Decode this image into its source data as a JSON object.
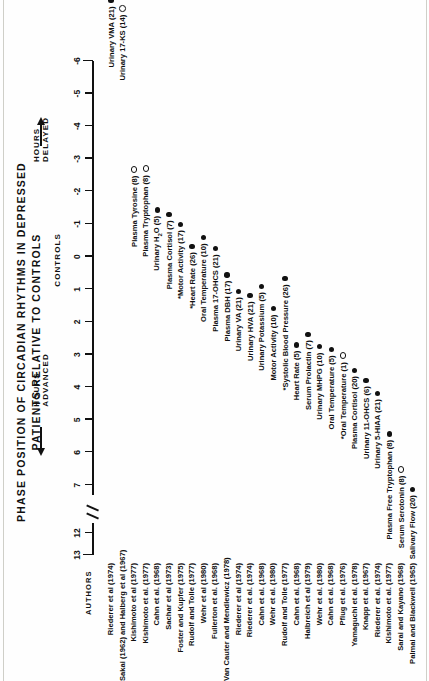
{
  "figure": {
    "title_line1": "PHASE  POSITION  OF  CIRCADIAN  RHYTHMS  IN  DEPRESSED",
    "title_line2": "PATIENTS  RELATIVE  TO  CONTROLS",
    "authors_header": "AUTHORS",
    "axis_label_left": "HOURS  ADVANCED",
    "axis_label_right": "HOURS  DELAYED",
    "axis_center_label": "CONTROLS",
    "tick_labels": [
      "13",
      "12",
      "7",
      "6",
      "5",
      "4",
      "3",
      "2",
      "1",
      "0",
      "-1",
      "-2",
      "-3",
      "-4",
      "-5",
      "-6"
    ],
    "legend_note": "Filled circle = significant/solid marker; Open circle = open marker"
  },
  "chart_data": {
    "type": "scatter",
    "title": "PHASE POSITION OF CIRCADIAN RHYTHMS IN DEPRESSED PATIENTS RELATIVE TO CONTROLS",
    "xlabel": "Hours advanced (positive) / Hours delayed (negative) relative to controls",
    "ylabel": "AUTHORS",
    "xlim": [
      13,
      -6
    ],
    "axis_break": {
      "between": [
        12,
        7
      ],
      "note": "axis break between 12 and 7"
    },
    "grid": false,
    "legend_position": "none",
    "tick_values": [
      13,
      12,
      7,
      6,
      5,
      4,
      3,
      2,
      1,
      0,
      -1,
      -2,
      -3,
      -4,
      -5,
      -6
    ],
    "tick_labels": [
      "13",
      "12",
      "7",
      "6",
      "5",
      "4",
      "3",
      "2",
      "1",
      "0",
      "-1",
      "-2",
      "-3",
      "-4",
      "-5",
      "-6"
    ],
    "marker_types": {
      "filled": "closed circle",
      "open": "open circle"
    },
    "points": [
      {
        "author": "Riederer et al  (1974)",
        "variable": "Urinary VMA (21)",
        "n": 21,
        "x": -6.0,
        "marker": "filled",
        "starred": false
      },
      {
        "author": "Sakai (1962) and Halberg et al  (1967)",
        "variable": "Urinary 17-KS (14)",
        "n": 14,
        "x": -5.6,
        "marker": "open",
        "starred": false
      },
      {
        "author": "Kishimoto et al  (1977)",
        "variable": "Plasma Tyrosine (8)",
        "n": 8,
        "x": -0.5,
        "marker": "open",
        "starred": false
      },
      {
        "author": "Kishimoto et al. (1977)",
        "variable": "Plasma Tryptophan (8)",
        "n": 8,
        "x": -0.2,
        "marker": "open",
        "starred": false
      },
      {
        "author": "Cahn et al. (1968)",
        "variable": "Urinary H2O (5)",
        "n": 5,
        "x": 0.2,
        "marker": "filled",
        "starred": false
      },
      {
        "author": "Sachar et al (1973)",
        "variable": "Plasma Cortisol (7)",
        "n": 7,
        "x": 0.8,
        "marker": "filled",
        "starred": false
      },
      {
        "author": "Foster and Kupfer  (1975)",
        "variable": "Motor Activity (17)",
        "n": 17,
        "x": 1.1,
        "marker": "filled",
        "starred": true
      },
      {
        "author": "Rudolf and Tolle  (1977)",
        "variable": "Heart Rate (26)",
        "n": 26,
        "x": 1.4,
        "marker": "filled",
        "starred": true
      },
      {
        "author": "Wehr et al  (1980)",
        "variable": "Oral Temperature (10)",
        "n": 10,
        "x": 1.8,
        "marker": "filled",
        "starred": false
      },
      {
        "author": "Fullerton et al. (1968)",
        "variable": "Plasma 17-OHCS (21)",
        "n": 21,
        "x": 2.1,
        "marker": "filled",
        "starred": false
      },
      {
        "author": "Van Cauter and  Mendlewicz  (1978)",
        "variable": "Plasma DBH (17)",
        "n": 17,
        "x": 2.4,
        "marker": "filled",
        "starred": false
      },
      {
        "author": "Riederer et al (1974)",
        "variable": "Urinary VA (21)",
        "n": 21,
        "x": 2.7,
        "marker": "filled",
        "starred": false
      },
      {
        "author": "Riederer et al. (1974)",
        "variable": "Urinary HVA (21)",
        "n": 21,
        "x": 3.0,
        "marker": "filled",
        "starred": false
      },
      {
        "author": "Cahn et al. (1968)",
        "variable": "Urinary Potassium (5)",
        "n": 5,
        "x": 3.3,
        "marker": "filled",
        "starred": false
      },
      {
        "author": "Wehr et al. (1980)",
        "variable": "Motor Activity (10)",
        "n": 10,
        "x": 3.6,
        "marker": "filled",
        "starred": false
      },
      {
        "author": "Rudolf and  Tolle (1977)",
        "variable": "Systolic Blood Pressure (26)",
        "n": 26,
        "x": 3.9,
        "marker": "filled",
        "starred": true
      },
      {
        "author": "Cahn et al. (1968)",
        "variable": "Heart Rate (5)",
        "n": 5,
        "x": 4.2,
        "marker": "filled",
        "starred": false
      },
      {
        "author": "Halbreich et al (1979)",
        "variable": "Serum Prolactin (7)",
        "n": 7,
        "x": 4.5,
        "marker": "filled",
        "starred": false
      },
      {
        "author": "Wehr et al. (1980)",
        "variable": "Urinary MHPG (10)",
        "n": 10,
        "x": 4.8,
        "marker": "filled",
        "starred": false
      },
      {
        "author": "Cahn et al. (1968)",
        "variable": "Oral Temperature (5)",
        "n": 5,
        "x": 5.1,
        "marker": "filled",
        "starred": false
      },
      {
        "author": "Pflug et al. (1976)",
        "variable": "Oral Temperature (1)",
        "n": 1,
        "x": 5.4,
        "marker": "open",
        "starred": true
      },
      {
        "author": "Yamaguchi et al. (1978)",
        "variable": "Plasma Cortisol (20)",
        "n": 20,
        "x": 5.7,
        "marker": "filled",
        "starred": false
      },
      {
        "author": "Knapp et al. (1967)",
        "variable": "Urinary 11-OHCS (6)",
        "n": 6,
        "x": 6.0,
        "marker": "filled",
        "starred": false
      },
      {
        "author": "Riederer et al. (1974)",
        "variable": "Urinary 5-HIAA (21)",
        "n": 21,
        "x": 6.3,
        "marker": "filled",
        "starred": false
      },
      {
        "author": "Kishimoto et al. (1977)",
        "variable": "Plasma Free Tryptophan (8)",
        "n": 8,
        "x": 12.0,
        "marker": "filled",
        "starred": false
      },
      {
        "author": "Sarai and Kayano  (1968)",
        "variable": "Serum Serotonin (8)",
        "n": 8,
        "x": 12.4,
        "marker": "open",
        "starred": false
      },
      {
        "author": "Palmai and Blackwell (1965)",
        "variable": "Salivary Flow (20)",
        "n": 20,
        "x": 12.9,
        "marker": "filled",
        "starred": false
      }
    ]
  }
}
